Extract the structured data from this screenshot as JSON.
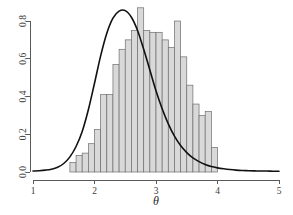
{
  "chart_data": {
    "type": "bar",
    "title": "",
    "subtitle": "",
    "xlabel": "θ",
    "ylabel": "",
    "xlim": [
      1,
      5
    ],
    "ylim": [
      0,
      0.9
    ],
    "grid": false,
    "legend": null,
    "x_ticks": [
      1,
      2,
      3,
      4,
      5
    ],
    "x_tick_labels": [
      "1",
      "2",
      "3",
      "4",
      "5"
    ],
    "y_ticks": [
      0.0,
      0.2,
      0.4,
      0.6,
      0.8
    ],
    "y_tick_labels": [
      "0.0",
      "0.2",
      "0.4",
      "0.6",
      "0.8"
    ],
    "bin_width": 0.1,
    "bar_fill_color": "#d9d9d9",
    "bar_border_color": "#6e6e6e",
    "curve_color": "#111111",
    "axis_color": "#5a5a5a",
    "bins": [
      {
        "x0": 1.6,
        "x1": 1.7,
        "density": 0.05
      },
      {
        "x0": 1.7,
        "x1": 1.8,
        "density": 0.09
      },
      {
        "x0": 1.8,
        "x1": 1.9,
        "density": 0.1
      },
      {
        "x0": 1.9,
        "x1": 2.0,
        "density": 0.15
      },
      {
        "x0": 2.0,
        "x1": 2.1,
        "density": 0.22
      },
      {
        "x0": 2.1,
        "x1": 2.2,
        "density": 0.41
      },
      {
        "x0": 2.2,
        "x1": 2.3,
        "density": 0.41
      },
      {
        "x0": 2.3,
        "x1": 2.4,
        "density": 0.57
      },
      {
        "x0": 2.4,
        "x1": 2.5,
        "density": 0.65
      },
      {
        "x0": 2.5,
        "x1": 2.6,
        "density": 0.7
      },
      {
        "x0": 2.6,
        "x1": 2.7,
        "density": 0.75
      },
      {
        "x0": 2.7,
        "x1": 2.8,
        "density": 0.87
      },
      {
        "x0": 2.8,
        "x1": 2.9,
        "density": 0.75
      },
      {
        "x0": 2.9,
        "x1": 3.0,
        "density": 0.74
      },
      {
        "x0": 3.0,
        "x1": 3.1,
        "density": 0.74
      },
      {
        "x0": 3.1,
        "x1": 3.2,
        "density": 0.7
      },
      {
        "x0": 3.2,
        "x1": 3.3,
        "density": 0.66
      },
      {
        "x0": 3.3,
        "x1": 3.4,
        "density": 0.8
      },
      {
        "x0": 3.4,
        "x1": 3.5,
        "density": 0.61
      },
      {
        "x0": 3.5,
        "x1": 3.6,
        "density": 0.46
      },
      {
        "x0": 3.6,
        "x1": 3.7,
        "density": 0.36
      },
      {
        "x0": 3.7,
        "x1": 3.8,
        "density": 0.3
      },
      {
        "x0": 3.8,
        "x1": 3.9,
        "density": 0.32
      },
      {
        "x0": 3.9,
        "x1": 4.0,
        "density": 0.13
      },
      {
        "x0": 4.0,
        "x1": 4.1,
        "density": 0.11
      },
      {
        "x0": 4.1,
        "x1": 4.2,
        "density": 0.06
      },
      {
        "x0": 4.2,
        "x1": 4.3,
        "density": 0.13
      },
      {
        "x0": 4.3,
        "x1": 4.4,
        "density": 0.04
      },
      {
        "x0": 4.4,
        "x1": 4.5,
        "density": 0.03
      }
    ],
    "bins_note": "bin x-values are indices into plotted theta scale; see bins_plot",
    "bins_plot": [
      {
        "x0": 1.6,
        "x1": 1.7,
        "density": 0.05
      },
      {
        "x0": 1.7,
        "x1": 1.8,
        "density": 0.088
      },
      {
        "x0": 1.8,
        "x1": 1.9,
        "density": 0.1
      },
      {
        "x0": 1.9,
        "x1": 2.0,
        "density": 0.15
      },
      {
        "x0": 2.0,
        "x1": 2.1,
        "density": 0.225
      },
      {
        "x0": 2.1,
        "x1": 2.2,
        "density": 0.41
      },
      {
        "x0": 2.2,
        "x1": 2.3,
        "density": 0.41
      },
      {
        "x0": 2.3,
        "x1": 2.4,
        "density": 0.57
      },
      {
        "x0": 2.4,
        "x1": 2.5,
        "density": 0.65
      },
      {
        "x0": 2.5,
        "x1": 2.6,
        "density": 0.7
      },
      {
        "x0": 2.6,
        "x1": 2.7,
        "density": 0.75
      },
      {
        "x0": 2.7,
        "x1": 2.8,
        "density": 0.87
      },
      {
        "x0": 2.8,
        "x1": 2.9,
        "density": 0.75
      },
      {
        "x0": 2.9,
        "x1": 3.0,
        "density": 0.74
      },
      {
        "x0": 3.0,
        "x1": 3.1,
        "density": 0.74
      },
      {
        "x0": 3.1,
        "x1": 3.2,
        "density": 0.7
      },
      {
        "x0": 3.2,
        "x1": 3.3,
        "density": 0.66
      },
      {
        "x0": 3.3,
        "x1": 3.4,
        "density": 0.8
      },
      {
        "x0": 3.4,
        "x1": 3.5,
        "density": 0.61
      },
      {
        "x0": 3.5,
        "x1": 3.6,
        "density": 0.46
      },
      {
        "x0": 3.6,
        "x1": 3.7,
        "density": 0.36
      },
      {
        "x0": 3.7,
        "x1": 3.8,
        "density": 0.3
      },
      {
        "x0": 3.8,
        "x1": 3.9,
        "density": 0.32
      },
      {
        "x0": 3.9,
        "x1": 4.0,
        "density": 0.13
      }
    ],
    "curve": {
      "name": "fitted density",
      "mean": 2.52,
      "peak_density": 0.855,
      "points_x": [
        1.0,
        1.1,
        1.2,
        1.3,
        1.4,
        1.5,
        1.6,
        1.7,
        1.8,
        1.9,
        2.0,
        2.1,
        2.2,
        2.3,
        2.4,
        2.5,
        2.6,
        2.7,
        2.8,
        2.9,
        3.0,
        3.1,
        3.2,
        3.3,
        3.4,
        3.5,
        3.6,
        3.7,
        3.8,
        3.9,
        4.0,
        4.1,
        4.2,
        4.3,
        4.4,
        4.5,
        4.6,
        4.7,
        4.8,
        4.9,
        5.0
      ],
      "points_y": [
        0.005,
        0.007,
        0.01,
        0.015,
        0.025,
        0.045,
        0.08,
        0.135,
        0.215,
        0.33,
        0.47,
        0.615,
        0.735,
        0.815,
        0.852,
        0.855,
        0.82,
        0.75,
        0.65,
        0.54,
        0.43,
        0.335,
        0.255,
        0.19,
        0.14,
        0.103,
        0.075,
        0.055,
        0.04,
        0.029,
        0.022,
        0.017,
        0.013,
        0.01,
        0.008,
        0.007,
        0.006,
        0.005,
        0.005,
        0.004,
        0.004
      ]
    }
  },
  "labels": {
    "x_axis_title": "θ"
  }
}
